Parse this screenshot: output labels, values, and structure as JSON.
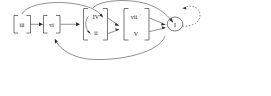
{
  "diagram": {
    "type": "directed-graph",
    "background_color": "#ffffff",
    "line_color": "#2b2b2b",
    "text_color": "#111111",
    "nodes": [
      {
        "id": "iii",
        "label": "iii",
        "shape": "bracketed",
        "x": 44,
        "y": 48
      },
      {
        "id": "vi",
        "label": "vi",
        "shape": "bracketed",
        "x": 103,
        "y": 48
      },
      {
        "id": "IV",
        "label": "IV",
        "shape": "bracketed-group-top",
        "x": 190,
        "y": 33
      },
      {
        "id": "ii",
        "label": "ii",
        "shape": "bracketed-group-bottom",
        "x": 190,
        "y": 64
      },
      {
        "id": "vii",
        "label": "vii",
        "superscript": "°",
        "shape": "bracketed-group-top",
        "x": 272,
        "y": 33
      },
      {
        "id": "V",
        "label": "V",
        "shape": "bracketed-group-bottom",
        "x": 272,
        "y": 64
      },
      {
        "id": "I",
        "label": "I",
        "shape": "circle",
        "x": 350,
        "y": 48
      }
    ],
    "edges": [
      {
        "from": "iii",
        "to": "vi",
        "style": "solid",
        "kind": "straight"
      },
      {
        "from": "vi",
        "to": "IV-ii-group",
        "style": "solid",
        "kind": "straight"
      },
      {
        "from": "iii",
        "to": "IV-ii-group",
        "style": "solid",
        "kind": "arc-over"
      },
      {
        "from": "IV",
        "to": "ii",
        "style": "solid",
        "kind": "curve-inner"
      },
      {
        "from": "IV",
        "to": "vii-V-group",
        "style": "solid",
        "kind": "straight"
      },
      {
        "from": "ii",
        "to": "vii-V-group",
        "style": "solid",
        "kind": "straight"
      },
      {
        "from": "IV-ii-group",
        "to": "I",
        "style": "solid",
        "kind": "arc-over"
      },
      {
        "from": "vii",
        "to": "I",
        "style": "solid",
        "kind": "straight"
      },
      {
        "from": "V",
        "to": "I",
        "style": "solid",
        "kind": "straight"
      },
      {
        "from": "V-group",
        "to": "vi",
        "style": "solid",
        "kind": "arc-under"
      },
      {
        "from": "I",
        "to": "I",
        "style": "dashed",
        "kind": "self-loop"
      }
    ]
  }
}
